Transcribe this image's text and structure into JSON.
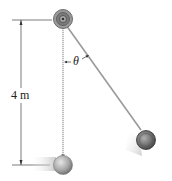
{
  "figure": {
    "dimension_label": "4 m",
    "angle_label": "θ",
    "colors": {
      "rope": "#9a9a9a",
      "dimension_line": "#333333",
      "pivot_outer": "#8a8a8a",
      "pivot_inner": "#5a5a5a",
      "ball_light": "#bfbfbf",
      "ball_dark": "#4a4a4a",
      "background": "#ffffff"
    }
  }
}
